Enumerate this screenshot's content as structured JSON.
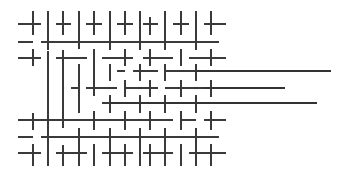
{
  "figure": {
    "type": "line-segment-lattice",
    "width": 346,
    "height": 174,
    "background_color": "#ffffff",
    "stroke_color": "#3a3a3a",
    "long_stroke_color": "#333333",
    "stroke_width": 2
  },
  "geometry": {
    "column_x": [
      33,
      48,
      63,
      79,
      94,
      110,
      125,
      140,
      150,
      165,
      181,
      196,
      211
    ],
    "row_y": [
      24,
      42,
      58,
      71,
      88,
      103,
      120,
      137,
      153
    ],
    "column_spacing": 15.5,
    "row_spacing": 15.5,
    "lattice_left": 18,
    "lattice_right": 226,
    "lattice_top": 11,
    "lattice_bottom": 166
  },
  "chart_data": {
    "type": "line",
    "xlabel": "",
    "ylabel": "",
    "grid": false,
    "legend": null,
    "xlim": [
      0,
      346
    ],
    "ylim": [
      0,
      174
    ],
    "vertical_segments": [
      {
        "x": 33,
        "y1": 11,
        "y2": 35
      },
      {
        "x": 33,
        "y1": 49,
        "y2": 66
      },
      {
        "x": 33,
        "y1": 113,
        "y2": 130
      },
      {
        "x": 33,
        "y1": 144,
        "y2": 166
      },
      {
        "x": 48,
        "y1": 11,
        "y2": 50
      },
      {
        "x": 48,
        "y1": 51,
        "y2": 129
      },
      {
        "x": 48,
        "y1": 129,
        "y2": 166
      },
      {
        "x": 63,
        "y1": 11,
        "y2": 35
      },
      {
        "x": 63,
        "y1": 50,
        "y2": 128
      },
      {
        "x": 63,
        "y1": 145,
        "y2": 166
      },
      {
        "x": 79,
        "y1": 11,
        "y2": 49
      },
      {
        "x": 79,
        "y1": 64,
        "y2": 113
      },
      {
        "x": 79,
        "y1": 128,
        "y2": 166
      },
      {
        "x": 94,
        "y1": 11,
        "y2": 35
      },
      {
        "x": 94,
        "y1": 49,
        "y2": 96
      },
      {
        "x": 94,
        "y1": 111,
        "y2": 130
      },
      {
        "x": 94,
        "y1": 144,
        "y2": 166
      },
      {
        "x": 110,
        "y1": 11,
        "y2": 50
      },
      {
        "x": 110,
        "y1": 64,
        "y2": 81
      },
      {
        "x": 110,
        "y1": 95,
        "y2": 113
      },
      {
        "x": 110,
        "y1": 128,
        "y2": 166
      },
      {
        "x": 125,
        "y1": 11,
        "y2": 35
      },
      {
        "x": 125,
        "y1": 49,
        "y2": 66
      },
      {
        "x": 125,
        "y1": 80,
        "y2": 97
      },
      {
        "x": 125,
        "y1": 111,
        "y2": 130
      },
      {
        "x": 125,
        "y1": 144,
        "y2": 166
      },
      {
        "x": 140,
        "y1": 11,
        "y2": 50
      },
      {
        "x": 140,
        "y1": 64,
        "y2": 81
      },
      {
        "x": 140,
        "y1": 95,
        "y2": 113
      },
      {
        "x": 140,
        "y1": 128,
        "y2": 166
      },
      {
        "x": 150,
        "y1": 17,
        "y2": 35
      },
      {
        "x": 150,
        "y1": 49,
        "y2": 66
      },
      {
        "x": 150,
        "y1": 80,
        "y2": 97
      },
      {
        "x": 150,
        "y1": 111,
        "y2": 130
      },
      {
        "x": 150,
        "y1": 144,
        "y2": 166
      },
      {
        "x": 165,
        "y1": 11,
        "y2": 50
      },
      {
        "x": 165,
        "y1": 64,
        "y2": 81
      },
      {
        "x": 165,
        "y1": 95,
        "y2": 113
      },
      {
        "x": 165,
        "y1": 128,
        "y2": 166
      },
      {
        "x": 181,
        "y1": 11,
        "y2": 35
      },
      {
        "x": 181,
        "y1": 49,
        "y2": 66
      },
      {
        "x": 181,
        "y1": 80,
        "y2": 97
      },
      {
        "x": 181,
        "y1": 111,
        "y2": 130
      },
      {
        "x": 181,
        "y1": 144,
        "y2": 166
      },
      {
        "x": 196,
        "y1": 11,
        "y2": 50
      },
      {
        "x": 196,
        "y1": 64,
        "y2": 81
      },
      {
        "x": 196,
        "y1": 95,
        "y2": 113
      },
      {
        "x": 196,
        "y1": 128,
        "y2": 166
      },
      {
        "x": 211,
        "y1": 11,
        "y2": 35
      },
      {
        "x": 211,
        "y1": 49,
        "y2": 66
      },
      {
        "x": 211,
        "y1": 80,
        "y2": 97
      },
      {
        "x": 211,
        "y1": 111,
        "y2": 130
      },
      {
        "x": 211,
        "y1": 144,
        "y2": 166
      }
    ],
    "horizontal_segments": [
      {
        "y": 24,
        "x1": 18,
        "x2": 41
      },
      {
        "y": 24,
        "x1": 56,
        "x2": 71
      },
      {
        "y": 24,
        "x1": 86,
        "x2": 102
      },
      {
        "y": 24,
        "x1": 117,
        "x2": 133
      },
      {
        "y": 24,
        "x1": 143,
        "x2": 158
      },
      {
        "y": 24,
        "x1": 173,
        "x2": 189
      },
      {
        "y": 24,
        "x1": 204,
        "x2": 226
      },
      {
        "y": 42,
        "x1": 18,
        "x2": 33
      },
      {
        "y": 42,
        "x1": 41,
        "x2": 71
      },
      {
        "y": 42,
        "x1": 71,
        "x2": 102
      },
      {
        "y": 42,
        "x1": 102,
        "x2": 133
      },
      {
        "y": 42,
        "x1": 133,
        "x2": 158
      },
      {
        "y": 42,
        "x1": 158,
        "x2": 189
      },
      {
        "y": 42,
        "x1": 189,
        "x2": 219
      },
      {
        "y": 58,
        "x1": 18,
        "x2": 41
      },
      {
        "y": 58,
        "x1": 56,
        "x2": 87
      },
      {
        "y": 58,
        "x1": 102,
        "x2": 133
      },
      {
        "y": 58,
        "x1": 143,
        "x2": 173
      },
      {
        "y": 58,
        "x1": 189,
        "x2": 226
      },
      {
        "y": 71,
        "x1": 117,
        "x2": 125
      },
      {
        "y": 71,
        "x1": 133,
        "x2": 158
      },
      {
        "y": 71,
        "x1": 165,
        "x2": 196
      },
      {
        "y": 88,
        "x1": 71,
        "x2": 79
      },
      {
        "y": 88,
        "x1": 86,
        "x2": 117
      },
      {
        "y": 88,
        "x1": 125,
        "x2": 158
      },
      {
        "y": 88,
        "x1": 165,
        "x2": 204
      },
      {
        "y": 103,
        "x1": 102,
        "x2": 133
      },
      {
        "y": 103,
        "x1": 143,
        "x2": 173
      },
      {
        "y": 103,
        "x1": 181,
        "x2": 196
      },
      {
        "y": 120,
        "x1": 18,
        "x2": 56
      },
      {
        "y": 120,
        "x1": 56,
        "x2": 87
      },
      {
        "y": 120,
        "x1": 87,
        "x2": 117
      },
      {
        "y": 120,
        "x1": 117,
        "x2": 148
      },
      {
        "y": 120,
        "x1": 148,
        "x2": 173
      },
      {
        "y": 120,
        "x1": 181,
        "x2": 196
      },
      {
        "y": 120,
        "x1": 204,
        "x2": 226
      },
      {
        "y": 137,
        "x1": 18,
        "x2": 33
      },
      {
        "y": 137,
        "x1": 41,
        "x2": 71
      },
      {
        "y": 137,
        "x1": 71,
        "x2": 102
      },
      {
        "y": 137,
        "x1": 102,
        "x2": 133
      },
      {
        "y": 137,
        "x1": 133,
        "x2": 158
      },
      {
        "y": 137,
        "x1": 158,
        "x2": 189
      },
      {
        "y": 137,
        "x1": 189,
        "x2": 219
      },
      {
        "y": 153,
        "x1": 18,
        "x2": 41
      },
      {
        "y": 153,
        "x1": 56,
        "x2": 87
      },
      {
        "y": 153,
        "x1": 102,
        "x2": 133
      },
      {
        "y": 153,
        "x1": 143,
        "x2": 173
      },
      {
        "y": 153,
        "x1": 189,
        "x2": 226
      }
    ],
    "long_horizontal_lines": [
      {
        "y": 71,
        "x1": 196,
        "x2": 331,
        "name": "long-line-top"
      },
      {
        "y": 88,
        "x1": 204,
        "x2": 285,
        "name": "long-line-middle"
      },
      {
        "y": 103,
        "x1": 110,
        "x2": 317,
        "name": "long-line-bottom"
      }
    ]
  }
}
